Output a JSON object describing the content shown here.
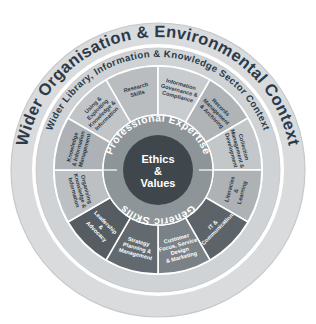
{
  "diagram": {
    "outer_ring_label": "Wider Organisation & Environmental Context",
    "second_ring_label": "Wider Library, Information & Knowledge Sector Context",
    "professional_expertise_label": "Professional Expertise",
    "generic_skills_label": "Generic Skills",
    "core": {
      "line1": "Ethics",
      "line2": "&",
      "line3": "Values"
    },
    "colors": {
      "background": "#ffffff",
      "outer_ring_fill": "#d8dadc",
      "outer_ring_stroke": "#c3c6c9",
      "white_gap": "#ffffff",
      "second_ring_fill": "#cfd2d4",
      "inner_band_fill": "#8e9599",
      "core_fill": "#3f474d",
      "label_dark": "#2b3a4a",
      "label_light": "#ffffff"
    },
    "segments": [
      {
        "id": "research-skills",
        "label": "Research\nSkills",
        "group": "professional-expertise",
        "fill": "#b9bdc0",
        "text": "dark"
      },
      {
        "id": "information-governance-compliance",
        "label": "Information\nGovernance &\nCompliance",
        "group": "professional-expertise",
        "fill": "#c9ccce",
        "text": "dark"
      },
      {
        "id": "records-management-archiving",
        "label": "Records\nManagement\n& Archiving",
        "group": "professional-expertise",
        "fill": "#b0b4b7",
        "text": "dark"
      },
      {
        "id": "collection-management-development",
        "label": "Collection\nManagement &\nDevelopment",
        "group": "professional-expertise",
        "fill": "#c4c7c9",
        "text": "dark"
      },
      {
        "id": "literacies-learning",
        "label": "Literacies\n&\nLearning",
        "group": "professional-expertise",
        "fill": "#aeb2b5",
        "text": "dark"
      },
      {
        "id": "it-communication",
        "label": "IT &\nCommunication",
        "group": "generic-skills",
        "fill": "#5d6469",
        "text": "light"
      },
      {
        "id": "customer-focus-service-design-marketing",
        "label": "Customer\nFocus, Service\nDesign\n& Marketing",
        "group": "generic-skills",
        "fill": "#7b8287",
        "text": "light"
      },
      {
        "id": "strategy-planning-management",
        "label": "Strategy\nPlanning &\nManagement",
        "group": "generic-skills",
        "fill": "#636a6f",
        "text": "light"
      },
      {
        "id": "leadership-advocacy",
        "label": "Leadership\n&\nAdvocacy",
        "group": "generic-skills",
        "fill": "#565d62",
        "text": "light"
      },
      {
        "id": "organising-knowledge-information",
        "label": "Organising\nKnowledge &\nInformation",
        "group": "professional-expertise",
        "fill": "#bcc0c3",
        "text": "dark"
      },
      {
        "id": "knowledge-information-management",
        "label": "Knowledge\n& Information\nManagement",
        "group": "professional-expertise",
        "fill": "#aeb2b6",
        "text": "dark"
      },
      {
        "id": "using-exploiting-knowledge-information",
        "label": "Using &\nExploiting\nKnowledge &\nInformation",
        "group": "professional-expertise",
        "fill": "#c2c5c8",
        "text": "dark"
      }
    ]
  }
}
